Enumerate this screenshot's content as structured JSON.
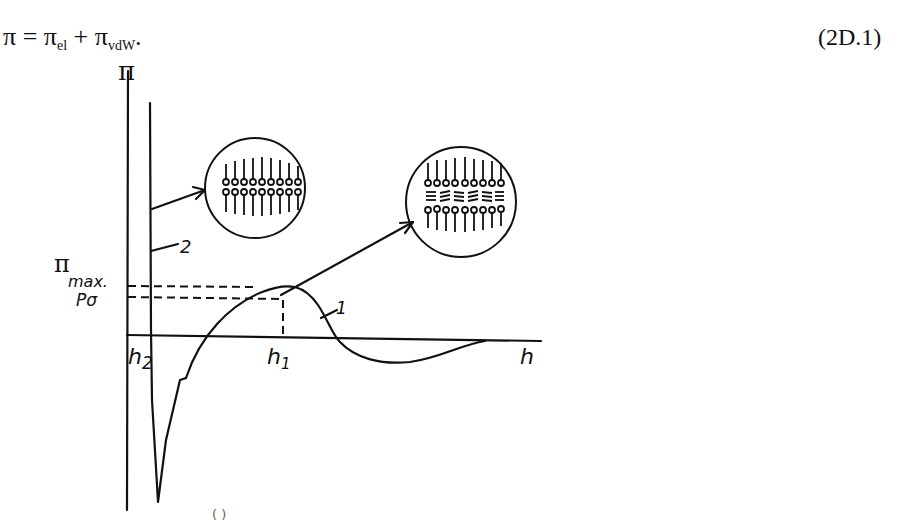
{
  "equation": {
    "lhs": "π",
    "equals": "=",
    "term1_symbol": "π",
    "term1_sub": "el",
    "plus": "+",
    "term2_symbol": "π",
    "term2_sub": "vdW",
    "trailing": ".",
    "number": "(2D.1)"
  },
  "figure": {
    "y_axis_label": "π",
    "pi_max_symbol": "π",
    "pi_max_sub": "max.",
    "p_sigma_label": "Pσ",
    "x_axis_label": "h",
    "h1_label": "h",
    "h1_sub": "1",
    "h2_label": "h",
    "h2_sub": "2",
    "curve1_label": "1",
    "curve2_label": "2",
    "caption_fragment": "( )",
    "insets": [
      {
        "name": "bilayer-film-inset",
        "description": "Newton black film: two monolayers of surfactant molecules in contact"
      },
      {
        "name": "common-black-film-inset",
        "description": "Common black film: two surfactant monolayers separated by an aqueous core"
      }
    ],
    "colors": {
      "ink": "#111111",
      "background": "#ffffff"
    }
  }
}
